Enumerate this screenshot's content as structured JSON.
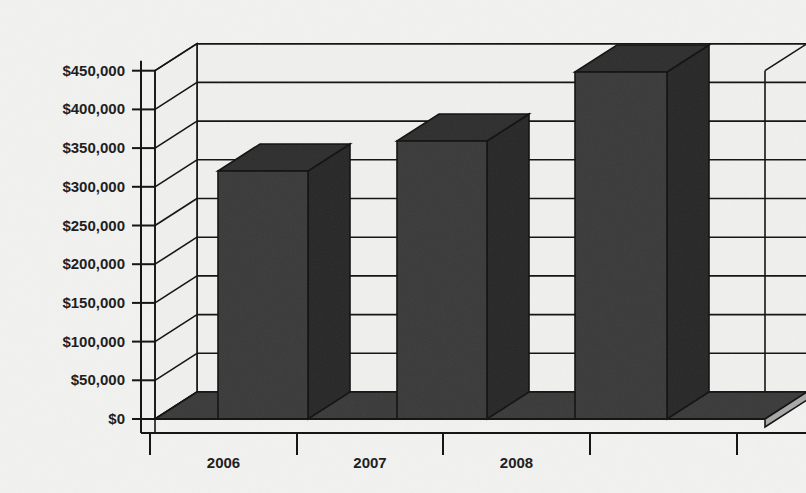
{
  "chart_data": {
    "type": "bar",
    "title": "",
    "subtitle": "",
    "xlabel": "",
    "ylabel": "",
    "categories": [
      "2006",
      "2007",
      "2008"
    ],
    "values": [
      320000,
      359000,
      448000
    ],
    "series": [
      {
        "name": "Amount",
        "values": [
          320000,
          359000,
          448000
        ]
      }
    ],
    "ytick_labels": [
      "$450,000",
      "$400,000",
      "$350,000",
      "$300,000",
      "$250,000",
      "$200,000",
      "$150,000",
      "$100,000",
      "$50,000",
      "$0"
    ],
    "ytick_values": [
      450000,
      400000,
      350000,
      300000,
      250000,
      200000,
      150000,
      100000,
      50000,
      0
    ],
    "ylim": [
      0,
      450000
    ],
    "ytick_step": 50000,
    "grid": true,
    "grid_axis": "y",
    "legend": false,
    "legend_position": "none",
    "projection": "3d",
    "style": "grayscale-scanned",
    "colors": {
      "bar_front": "#3a3a3a",
      "bar_top": "#2e2e2e",
      "bar_side": "#272727",
      "floor": "#3a3a3a",
      "floor_edge": "#a8a8a8",
      "wall": "#f0f0ee",
      "line": "#111111",
      "text": "#1a1a1a",
      "background": "#f2f2f0"
    }
  },
  "geometry": {
    "origin_x": 141,
    "origin_y": 419,
    "px_per_step": 38.7,
    "depth_dx": 42,
    "depth_dy": -27,
    "plot_right_x": 765,
    "axis_band_width": 14,
    "category_tick_x": [
      150,
      297,
      443,
      590,
      737
    ],
    "bars": [
      {
        "category": "2006",
        "front_left": 218,
        "front_right": 308,
        "top_y": 171
      },
      {
        "category": "2007",
        "front_left": 397,
        "front_right": 487,
        "top_y": 141
      },
      {
        "category": "2008",
        "front_left": 575,
        "front_right": 667,
        "top_y": 72
      }
    ]
  }
}
